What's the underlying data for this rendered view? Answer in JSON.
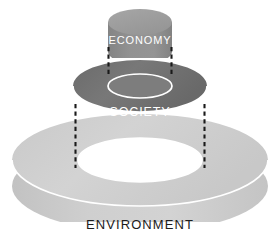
{
  "diagram": {
    "background_color": "#ffffff",
    "layers": [
      {
        "id": "economy",
        "label": "ECONOMY",
        "role": "innermost-layer",
        "shape": "cylinder",
        "fill_color": "#8d8d8d",
        "top_color": "#a0a0a0",
        "label_color": "#ffffff",
        "order": 1
      },
      {
        "id": "society",
        "label": "SOCIETY",
        "role": "middle-layer",
        "shape": "torus",
        "fill_color": "#6e6e6e",
        "top_color": "#7b7b7b",
        "label_color": "#ffffff",
        "order": 2
      },
      {
        "id": "environment",
        "label": "ENVIRONMENT",
        "role": "outermost-layer",
        "shape": "torus",
        "fill_color": "#cdcdcd",
        "top_color": "#d4d4d4",
        "label_color": "#1c1c1c",
        "order": 3
      }
    ],
    "connectors": {
      "name": "dashed-alignment-lines",
      "style": "dashed",
      "color": "#1a1a1a",
      "count": 4
    }
  }
}
